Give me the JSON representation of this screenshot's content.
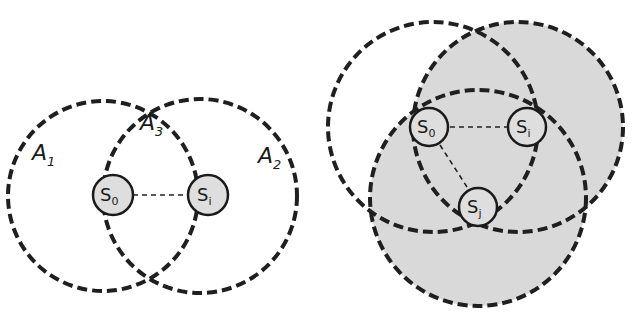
{
  "left_diagram": {
    "regions": [
      {
        "label": "A",
        "sub": "1"
      },
      {
        "label": "A",
        "sub": "3"
      },
      {
        "label": "A",
        "sub": "2"
      }
    ],
    "nodes": [
      {
        "label": "S",
        "sub": "0"
      },
      {
        "label": "S",
        "sub": "i"
      }
    ]
  },
  "right_diagram": {
    "nodes": [
      {
        "label": "S",
        "sub": "0"
      },
      {
        "label": "S",
        "sub": "i"
      },
      {
        "label": "S",
        "sub": "j"
      }
    ],
    "shade_color": "#d9d9d9"
  },
  "colors": {
    "stroke": "#1f1f1f",
    "node_fill": "#dedede",
    "background": "#ffffff"
  }
}
